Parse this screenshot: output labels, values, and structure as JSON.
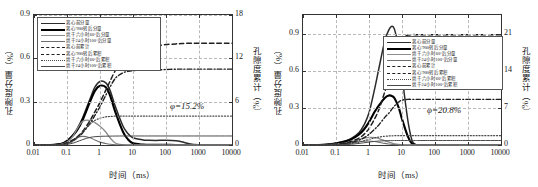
{
  "figure": {
    "background": "#ffffff",
    "ink": "#1a1a1a",
    "grid_color": "#b9b9b9"
  },
  "panels": [
    {
      "id": "left",
      "annotation": "φ=15.2%",
      "xaxis": {
        "label": "时间（ms）",
        "scale": "log",
        "ticks": [
          "0.01",
          "0.1",
          "1",
          "10",
          "100",
          "1000",
          "10000"
        ],
        "range": [
          0.01,
          10000
        ]
      },
      "yaxis_left": {
        "label": "孔隙度分量（%）",
        "ticks": [
          "0",
          "0.3",
          "0.6",
          "0.9"
        ],
        "range": [
          0,
          0.9
        ]
      },
      "yaxis_right": {
        "label": "孔隙度累计（%）",
        "ticks": [
          "0",
          "6",
          "12",
          "18"
        ],
        "range": [
          0,
          18
        ]
      },
      "legend": [
        {
          "label": "离心前分量",
          "style": "solid",
          "color": "#2b2b2b",
          "width": 1.5
        },
        {
          "label": "离心′900转后分量",
          "style": "solid",
          "color": "#000000",
          "width": 2.1
        },
        {
          "label": "烘干六小时60°后分量",
          "style": "solid",
          "color": "#8c8c8c",
          "width": 1.3
        },
        {
          "label": "烘干24小时100°后分量",
          "style": "solid",
          "color": "#6f6f6f",
          "width": 1.1
        },
        {
          "label": "离心前累计",
          "style": "dashed",
          "color": "#1f1f1f",
          "width": 1.5
        },
        {
          "label": "离心′900转后累积",
          "style": "dashdot",
          "color": "#1f1f1f",
          "width": 1.4
        },
        {
          "label": "烘干六小时60°后累积",
          "style": "dotted",
          "color": "#4a4a4a",
          "width": 1.2
        },
        {
          "label": "烘干24小时100°后累积",
          "style": "solid",
          "color": "#4a4a4a",
          "width": 1.0
        }
      ]
    },
    {
      "id": "right",
      "annotation": "φ=20.8%",
      "xaxis": {
        "label": "时间（ms）",
        "scale": "log",
        "ticks": [
          "0.01",
          "0.1",
          "1",
          "10",
          "100",
          "1000",
          "10000"
        ],
        "range": [
          0.01,
          10000
        ]
      },
      "yaxis_left": {
        "label": "孔隙度分量（%）",
        "ticks": [
          "0",
          "0.3",
          "0.6",
          "0.9"
        ],
        "range": [
          0,
          1.05
        ]
      },
      "yaxis_right": {
        "label": "孔隙度累计（%）",
        "ticks": [
          "0",
          "7",
          "14",
          "21"
        ],
        "range": [
          0,
          24.5
        ]
      },
      "legend": [
        {
          "label": "离心前分量",
          "style": "solid",
          "color": "#2b2b2b",
          "width": 1.5
        },
        {
          "label": "离心′900转后分量",
          "style": "solid",
          "color": "#000000",
          "width": 2.1
        },
        {
          "label": "烘干六小时60°后分量",
          "style": "solid",
          "color": "#8c8c8c",
          "width": 1.3
        },
        {
          "label": "烘干24小时100°后分量",
          "style": "solid",
          "color": "#6f6f6f",
          "width": 1.1
        },
        {
          "label": "离心前累计",
          "style": "dashed",
          "color": "#1f1f1f",
          "width": 1.5
        },
        {
          "label": "离心′900转后累积",
          "style": "dashdot",
          "color": "#1f1f1f",
          "width": 1.4
        },
        {
          "label": "烘干六小时60°后累积",
          "style": "dotted",
          "color": "#4a4a4a",
          "width": 1.2
        },
        {
          "label": "烘干24小时100°后累积",
          "style": "solid",
          "color": "#4a4a4a",
          "width": 1.0
        }
      ]
    }
  ],
  "chart_data": [
    {
      "type": "line",
      "panel": "left",
      "title": "",
      "xlabel": "时间（ms）",
      "ylabel": "孔隙度分量（%）",
      "ylabel_secondary": "孔隙度累计（%）",
      "xscale": "log",
      "xlim": [
        0.01,
        10000
      ],
      "ylim": [
        0,
        0.9
      ],
      "ylim_secondary": [
        0,
        18
      ],
      "grid": true,
      "legend_position": "upper-left",
      "annotation": "φ=15.2%",
      "x": [
        0.01,
        0.02,
        0.04,
        0.07,
        0.1,
        0.15,
        0.2,
        0.3,
        0.5,
        0.7,
        1,
        1.5,
        2,
        3,
        5,
        7,
        10,
        20,
        30,
        50,
        100,
        200,
        300,
        500,
        1000,
        3000,
        10000
      ],
      "series": [
        {
          "name": "离心前分量",
          "axis": "left",
          "style": "solid",
          "values": [
            0,
            0,
            0.002,
            0.01,
            0.03,
            0.07,
            0.11,
            0.19,
            0.32,
            0.4,
            0.44,
            0.43,
            0.38,
            0.26,
            0.13,
            0.08,
            0.05,
            0.035,
            0.033,
            0.032,
            0.033,
            0.03,
            0.022,
            0.008,
            0.001,
            0,
            0
          ]
        },
        {
          "name": "离心′900转后分量",
          "axis": "left",
          "style": "solid",
          "values": [
            0,
            0,
            0.002,
            0.009,
            0.027,
            0.065,
            0.1,
            0.175,
            0.3,
            0.375,
            0.41,
            0.4,
            0.345,
            0.22,
            0.09,
            0.04,
            0.012,
            0.003,
            0.002,
            0.001,
            0.001,
            0,
            0,
            0,
            0,
            0,
            0
          ]
        },
        {
          "name": "烘干六小时60°后分量",
          "axis": "left",
          "style": "solid",
          "values": [
            0,
            0,
            0.001,
            0.006,
            0.02,
            0.06,
            0.11,
            0.165,
            0.17,
            0.155,
            0.13,
            0.09,
            0.05,
            0.012,
            0.002,
            0.001,
            0,
            0,
            0,
            0,
            0,
            0,
            0,
            0,
            0,
            0,
            0
          ]
        },
        {
          "name": "烘干24小时100°后分量",
          "axis": "left",
          "style": "solid",
          "values": [
            0,
            0,
            0.001,
            0.004,
            0.012,
            0.03,
            0.05,
            0.06,
            0.05,
            0.035,
            0.02,
            0.01,
            0.005,
            0.002,
            0.001,
            0,
            0,
            0,
            0,
            0,
            0,
            0,
            0,
            0,
            0,
            0,
            0
          ]
        },
        {
          "name": "离心前累计",
          "axis": "right",
          "style": "dashed",
          "values": [
            0,
            0,
            0.02,
            0.1,
            0.3,
            0.7,
            1.1,
            1.9,
            3.4,
            4.6,
            5.9,
            7.6,
            8.8,
            10.4,
            11.7,
            12.3,
            12.8,
            13.3,
            13.5,
            13.7,
            13.9,
            14.0,
            14.05,
            14.1,
            14.1,
            14.1,
            14.1
          ]
        },
        {
          "name": "离心′900转后累积",
          "axis": "right",
          "style": "dashdot",
          "values": [
            0,
            0,
            0.02,
            0.09,
            0.25,
            0.6,
            1.0,
            1.7,
            3.0,
            4.1,
            5.3,
            6.9,
            8.0,
            9.3,
            10.0,
            10.2,
            10.3,
            10.35,
            10.4,
            10.4,
            10.45,
            10.5,
            10.5,
            10.5,
            10.5,
            10.5,
            10.5
          ]
        },
        {
          "name": "烘干六小时60°后累积",
          "axis": "right",
          "style": "dotted",
          "values": [
            0,
            0,
            0.01,
            0.05,
            0.18,
            0.5,
            0.95,
            1.8,
            2.9,
            3.4,
            3.7,
            3.9,
            3.95,
            4.0,
            4.0,
            4.0,
            4.0,
            4.0,
            4.0,
            4.0,
            4.0,
            4.0,
            4.0,
            4.0,
            4.0,
            4.0,
            4.0
          ]
        },
        {
          "name": "烘干24小时100°后累积",
          "axis": "right",
          "style": "solid",
          "values": [
            0,
            0,
            0.005,
            0.03,
            0.09,
            0.25,
            0.45,
            0.75,
            1.05,
            1.15,
            1.2,
            1.22,
            1.23,
            1.24,
            1.25,
            1.25,
            1.25,
            1.25,
            1.25,
            1.25,
            1.25,
            1.25,
            1.25,
            1.25,
            1.25,
            1.25,
            1.25
          ]
        }
      ]
    },
    {
      "type": "line",
      "panel": "right",
      "title": "",
      "xlabel": "时间（ms）",
      "ylabel": "孔隙度分量（%）",
      "ylabel_secondary": "孔隙度累计（%）",
      "xscale": "log",
      "xlim": [
        0.01,
        10000
      ],
      "ylim": [
        0,
        1.05
      ],
      "ylim_secondary": [
        0,
        24.5
      ],
      "grid": true,
      "legend_position": "center-right",
      "annotation": "φ=20.8%",
      "x": [
        0.01,
        0.02,
        0.04,
        0.07,
        0.1,
        0.2,
        0.3,
        0.5,
        0.7,
        1,
        1.5,
        2,
        3,
        4,
        5,
        6,
        8,
        10,
        15,
        20,
        25,
        30,
        50,
        100,
        300,
        1000,
        10000
      ],
      "series": [
        {
          "name": "离心前分量",
          "axis": "left",
          "style": "solid",
          "values": [
            0,
            0,
            0.002,
            0.008,
            0.015,
            0.035,
            0.055,
            0.1,
            0.16,
            0.26,
            0.46,
            0.62,
            0.84,
            0.93,
            0.96,
            0.93,
            0.78,
            0.56,
            0.2,
            0.04,
            0.005,
            0,
            0,
            0,
            0,
            0,
            0
          ]
        },
        {
          "name": "离心′900转后分量",
          "axis": "left",
          "style": "solid",
          "values": [
            0,
            0,
            0.002,
            0.007,
            0.013,
            0.03,
            0.048,
            0.085,
            0.125,
            0.185,
            0.27,
            0.32,
            0.38,
            0.4,
            0.395,
            0.375,
            0.3,
            0.21,
            0.07,
            0.012,
            0.002,
            0,
            0,
            0,
            0,
            0,
            0
          ]
        },
        {
          "name": "烘干六小时60°后分量",
          "axis": "left",
          "style": "solid",
          "values": [
            0,
            0,
            0.001,
            0.004,
            0.008,
            0.018,
            0.028,
            0.045,
            0.055,
            0.062,
            0.06,
            0.052,
            0.035,
            0.024,
            0.015,
            0.009,
            0.004,
            0.002,
            0,
            0,
            0,
            0,
            0,
            0,
            0,
            0,
            0
          ]
        },
        {
          "name": "烘干24小时100°后分量",
          "axis": "left",
          "style": "solid",
          "values": [
            0,
            0,
            0.001,
            0.003,
            0.005,
            0.011,
            0.017,
            0.026,
            0.03,
            0.032,
            0.028,
            0.022,
            0.013,
            0.008,
            0.005,
            0.003,
            0.001,
            0,
            0,
            0,
            0,
            0,
            0,
            0,
            0,
            0,
            0
          ]
        },
        {
          "name": "离心前累计",
          "axis": "right",
          "style": "dashed",
          "values": [
            0,
            0,
            0.02,
            0.08,
            0.15,
            0.4,
            0.7,
            1.3,
            2.0,
            3.1,
            5.0,
            6.7,
            10.0,
            12.4,
            14.6,
            16.5,
            19.0,
            20.2,
            20.7,
            20.8,
            20.8,
            20.8,
            20.8,
            20.8,
            20.8,
            20.8,
            20.8
          ]
        },
        {
          "name": "离心′900转后累积",
          "axis": "right",
          "style": "dashdot",
          "values": [
            0,
            0,
            0.01,
            0.05,
            0.1,
            0.28,
            0.48,
            0.9,
            1.35,
            2.0,
            3.0,
            3.8,
            5.2,
            6.0,
            6.8,
            7.4,
            8.1,
            8.45,
            8.6,
            8.6,
            8.6,
            8.6,
            8.6,
            8.6,
            8.6,
            8.6,
            8.6
          ]
        },
        {
          "name": "烘干六小时60°后累积",
          "axis": "right",
          "style": "dotted",
          "values": [
            0,
            0,
            0.005,
            0.02,
            0.05,
            0.15,
            0.28,
            0.55,
            0.78,
            1.05,
            1.35,
            1.5,
            1.65,
            1.7,
            1.73,
            1.75,
            1.76,
            1.76,
            1.76,
            1.76,
            1.76,
            1.76,
            1.76,
            1.76,
            1.76,
            1.76,
            1.76
          ]
        },
        {
          "name": "烘干24小时100°后累积",
          "axis": "right",
          "style": "solid",
          "values": [
            0,
            0,
            0.003,
            0.012,
            0.025,
            0.08,
            0.15,
            0.3,
            0.42,
            0.55,
            0.68,
            0.74,
            0.8,
            0.82,
            0.83,
            0.84,
            0.85,
            0.85,
            0.85,
            0.85,
            0.85,
            0.85,
            0.85,
            0.85,
            0.85,
            0.85,
            0.85
          ]
        }
      ]
    }
  ]
}
